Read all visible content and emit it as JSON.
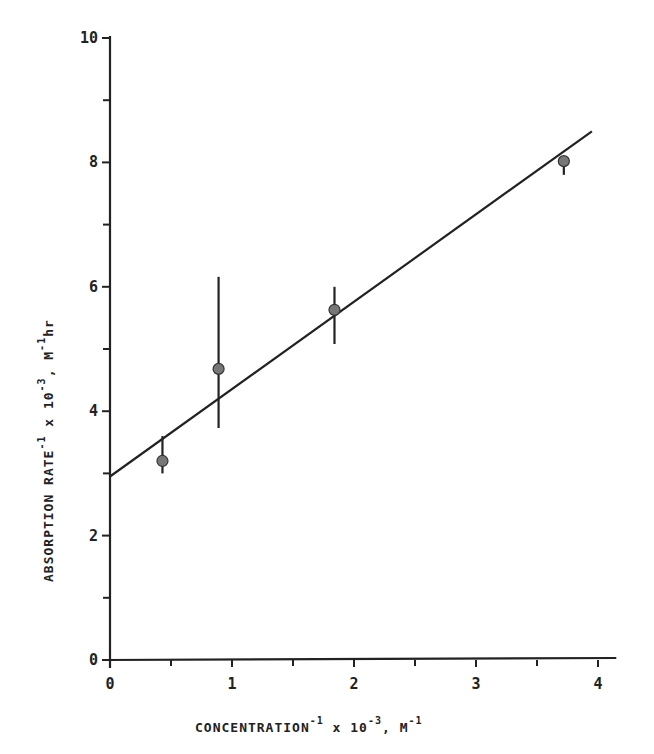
{
  "chart_data": {
    "type": "scatter",
    "title": "",
    "xlabel": "CONCENTRATION^-1 x 10^-3, M^-1",
    "ylabel": "ABSORPTION RATE^-1 x 10^-3, M^-1 hr",
    "xlabel_parts": {
      "main": "CONCENTRATION",
      "sup1": "-1",
      "mid": " x 10",
      "sup2": "-3",
      "end": ", M",
      "sup3": "-1"
    },
    "ylabel_parts": {
      "main": "ABSORPTION RATE",
      "sup1": "-1",
      "mid": " x 10",
      "sup2": "-3",
      "end": ", M",
      "sup3": "-1",
      "tail": "hr"
    },
    "xlim": [
      0,
      4.15
    ],
    "ylim": [
      0,
      10
    ],
    "x_ticks": [
      0,
      1,
      2,
      3,
      4
    ],
    "x_minor_ticks": [
      0.5,
      1.5,
      2.5,
      3.5
    ],
    "y_ticks": [
      0,
      2,
      4,
      6,
      8,
      10
    ],
    "y_minor_ticks": [
      1,
      3,
      5,
      7,
      9
    ],
    "grid": false,
    "legend": null,
    "series": [
      {
        "name": "measured",
        "type": "scatter",
        "marker": "filled-circle",
        "color": "#777777",
        "points": [
          {
            "x": 0.43,
            "y": 3.2,
            "err_low": 3.0,
            "err_high": 3.6
          },
          {
            "x": 0.89,
            "y": 4.68,
            "err_low": 3.73,
            "err_high": 6.16
          },
          {
            "x": 1.84,
            "y": 5.63,
            "err_low": 5.08,
            "err_high": 6.0
          },
          {
            "x": 3.72,
            "y": 8.02,
            "err_low": 7.8,
            "err_high": 8.1
          }
        ]
      },
      {
        "name": "linear fit",
        "type": "line",
        "color": "#222222",
        "points": [
          {
            "x": 0,
            "y": 2.95
          },
          {
            "x": 3.95,
            "y": 8.5
          }
        ]
      }
    ]
  }
}
